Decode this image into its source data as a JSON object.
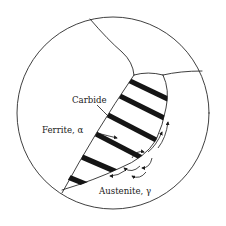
{
  "figure": {
    "labels": {
      "carbide": "Carbide",
      "ferrite": "Ferrite, α",
      "austenite": "Austenite, γ"
    },
    "colors": {
      "line": "#2a2a2a",
      "lamella": "#151515",
      "background": "#ffffff"
    }
  }
}
